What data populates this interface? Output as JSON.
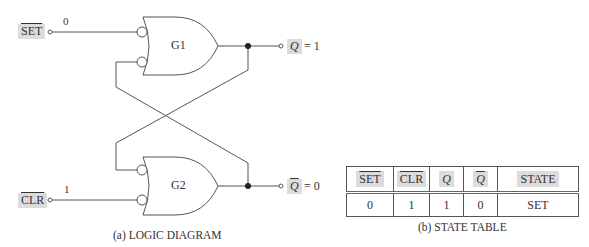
{
  "diagram": {
    "inputs": {
      "set": {
        "label": "SET",
        "value": "0",
        "active_low": true
      },
      "clr": {
        "label": "CLR",
        "value": "1",
        "active_low": true
      }
    },
    "gates": [
      {
        "id": "G1",
        "label": "G1",
        "type": "NAND (negative-OR with inverted inputs)"
      },
      {
        "id": "G2",
        "label": "G2",
        "type": "NAND (negative-OR with inverted inputs)"
      }
    ],
    "outputs": {
      "q": {
        "label": "Q",
        "equals": "= 1"
      },
      "q_bar": {
        "label": "Q",
        "equals": "= 0",
        "overbar": true
      }
    },
    "caption": "(a)  LOGIC DIAGRAM"
  },
  "state_table": {
    "headers": [
      "SET",
      "CLR",
      "Q",
      "Q",
      "STATE"
    ],
    "rows": [
      [
        "0",
        "1",
        "1",
        "0",
        "SET"
      ]
    ],
    "caption": "(b)  STATE TABLE"
  },
  "colors": {
    "label_bg": "#dcdcdc",
    "line": "#555555"
  }
}
